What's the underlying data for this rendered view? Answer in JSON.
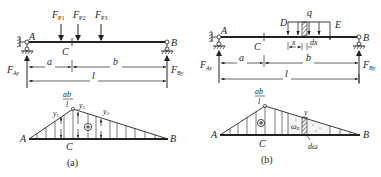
{
  "figure_a": {
    "caption": "(a)",
    "beam": {
      "support_left": "A",
      "support_right": "B",
      "section": "C",
      "reaction_left": "F",
      "reaction_left_sub": "Ay",
      "reaction_right": "F",
      "reaction_right_sub": "By",
      "loads": [
        {
          "label": "F",
          "sub": "P1"
        },
        {
          "label": "F",
          "sub": "P2"
        },
        {
          "label": "F",
          "sub": "P3"
        }
      ],
      "dim_a": "a",
      "dim_b": "b",
      "dim_l": "l"
    },
    "influence_line": {
      "peak_num": "ab",
      "peak_den": "l",
      "ordinates": [
        {
          "label": "y",
          "sub": "1"
        },
        {
          "label": "y",
          "sub": "2"
        },
        {
          "label": "y",
          "sub": "3"
        }
      ],
      "sign": "+",
      "left": "A",
      "right": "B",
      "section": "C"
    }
  },
  "figure_b": {
    "caption": "(b)",
    "beam": {
      "support_left": "A",
      "support_right": "B",
      "section": "C",
      "reaction_left": "F",
      "reaction_left_sub": "Ay",
      "reaction_right": "F",
      "reaction_right_sub": "By",
      "load_start": "D",
      "load_end": "E",
      "load_label": "q",
      "dim_x": "x",
      "dim_dx": "dx",
      "dim_a": "a",
      "dim_b": "b",
      "dim_l": "l"
    },
    "influence_line": {
      "peak_num": "ab",
      "peak_den": "l",
      "ordinate": "y",
      "area": "ω",
      "area_sub": "E",
      "differential_area": "dω",
      "sign": "+",
      "left": "A",
      "right": "B",
      "section": "C"
    }
  }
}
